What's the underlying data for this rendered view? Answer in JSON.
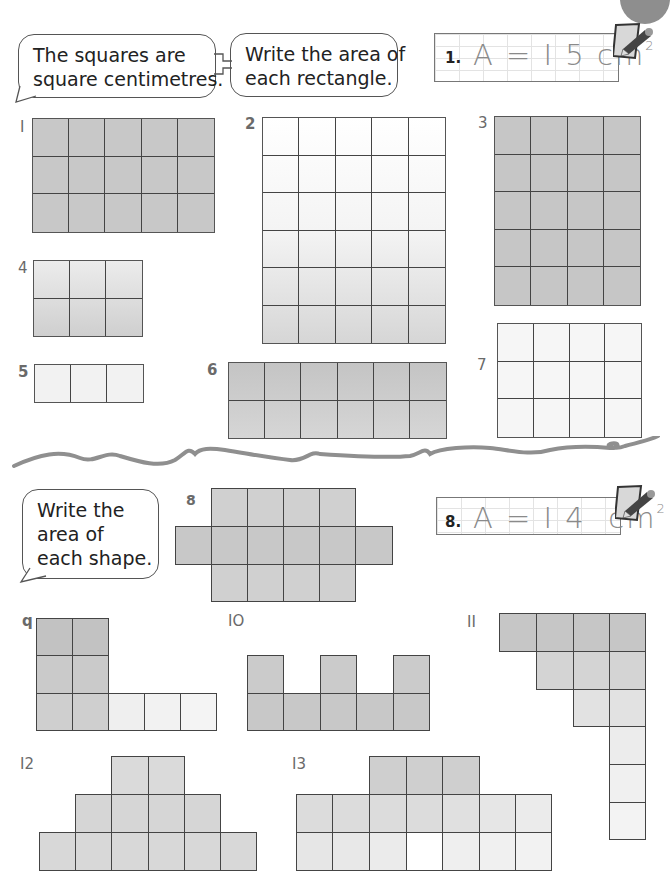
{
  "page": {
    "corner_marker": "page-corner-circle",
    "colors": {
      "shaded": "#c9c9c9",
      "light": "#ededed",
      "line": "#444444",
      "answer_text": "#8a8a8a",
      "wave": "#8f8f8f"
    }
  },
  "instructions": {
    "bubble_1": "The squares are\nsquare centimetres.",
    "bubble_2": "Write the area of\neach rectangle.",
    "bubble_3": "Write the\narea of\neach shape."
  },
  "examples": [
    {
      "number": "1.",
      "expression": "A = I 5 cm",
      "unit_power": "2",
      "icon": "pencil-icon"
    },
    {
      "number": "8.",
      "expression": "A = I 4  cm",
      "unit_power": "2",
      "icon": "pencil-icon"
    }
  ],
  "rectangles": [
    {
      "label": "I",
      "cols": 5,
      "rows": 3,
      "shade": "dark"
    },
    {
      "label": "2",
      "cols": 5,
      "rows": 6,
      "shade": "light"
    },
    {
      "label": "3",
      "cols": 4,
      "rows": 5,
      "shade": "dark"
    },
    {
      "label": "4",
      "cols": 3,
      "rows": 2,
      "shade": "mid"
    },
    {
      "label": "5",
      "cols": 3,
      "rows": 1,
      "shade": "light"
    },
    {
      "label": "6",
      "cols": 6,
      "rows": 2,
      "shade": "dark"
    },
    {
      "label": "7",
      "cols": 4,
      "rows": 3,
      "shade": "light"
    }
  ],
  "shapes": [
    {
      "label": "8",
      "rows": [
        "4 squares (cols 2-5)",
        "6 squares (cols 1-6)",
        "4 squares (cols 2-5)"
      ],
      "squares": 14
    },
    {
      "label": "q",
      "rows": [
        "2 squares",
        "2 squares",
        "5 squares"
      ],
      "squares": 9
    },
    {
      "label": "IO",
      "rows": [
        "3 squares (cols 1,3,5)",
        "5 squares"
      ],
      "squares": 8
    },
    {
      "label": "II",
      "rows": [
        "4",
        "3",
        "2",
        "1",
        "1",
        "1"
      ],
      "squares": 12
    },
    {
      "label": "I2",
      "rows": [
        "2",
        "4",
        "6"
      ]
    },
    {
      "label": "I3",
      "rows": [
        "3",
        "7",
        "7"
      ]
    }
  ]
}
